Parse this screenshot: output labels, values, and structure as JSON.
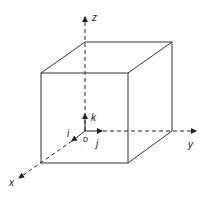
{
  "diagram": {
    "type": "cube-coordinate-axes",
    "stroke_color": "#222222",
    "background": "#ffffff",
    "axes": [
      {
        "name": "x",
        "label": "x"
      },
      {
        "name": "y",
        "label": "y"
      },
      {
        "name": "z",
        "label": "z"
      }
    ],
    "unit_vectors": [
      {
        "name": "i",
        "label": "i"
      },
      {
        "name": "j",
        "label": "j"
      },
      {
        "name": "k",
        "label": "k"
      }
    ],
    "origin_label": "o"
  }
}
